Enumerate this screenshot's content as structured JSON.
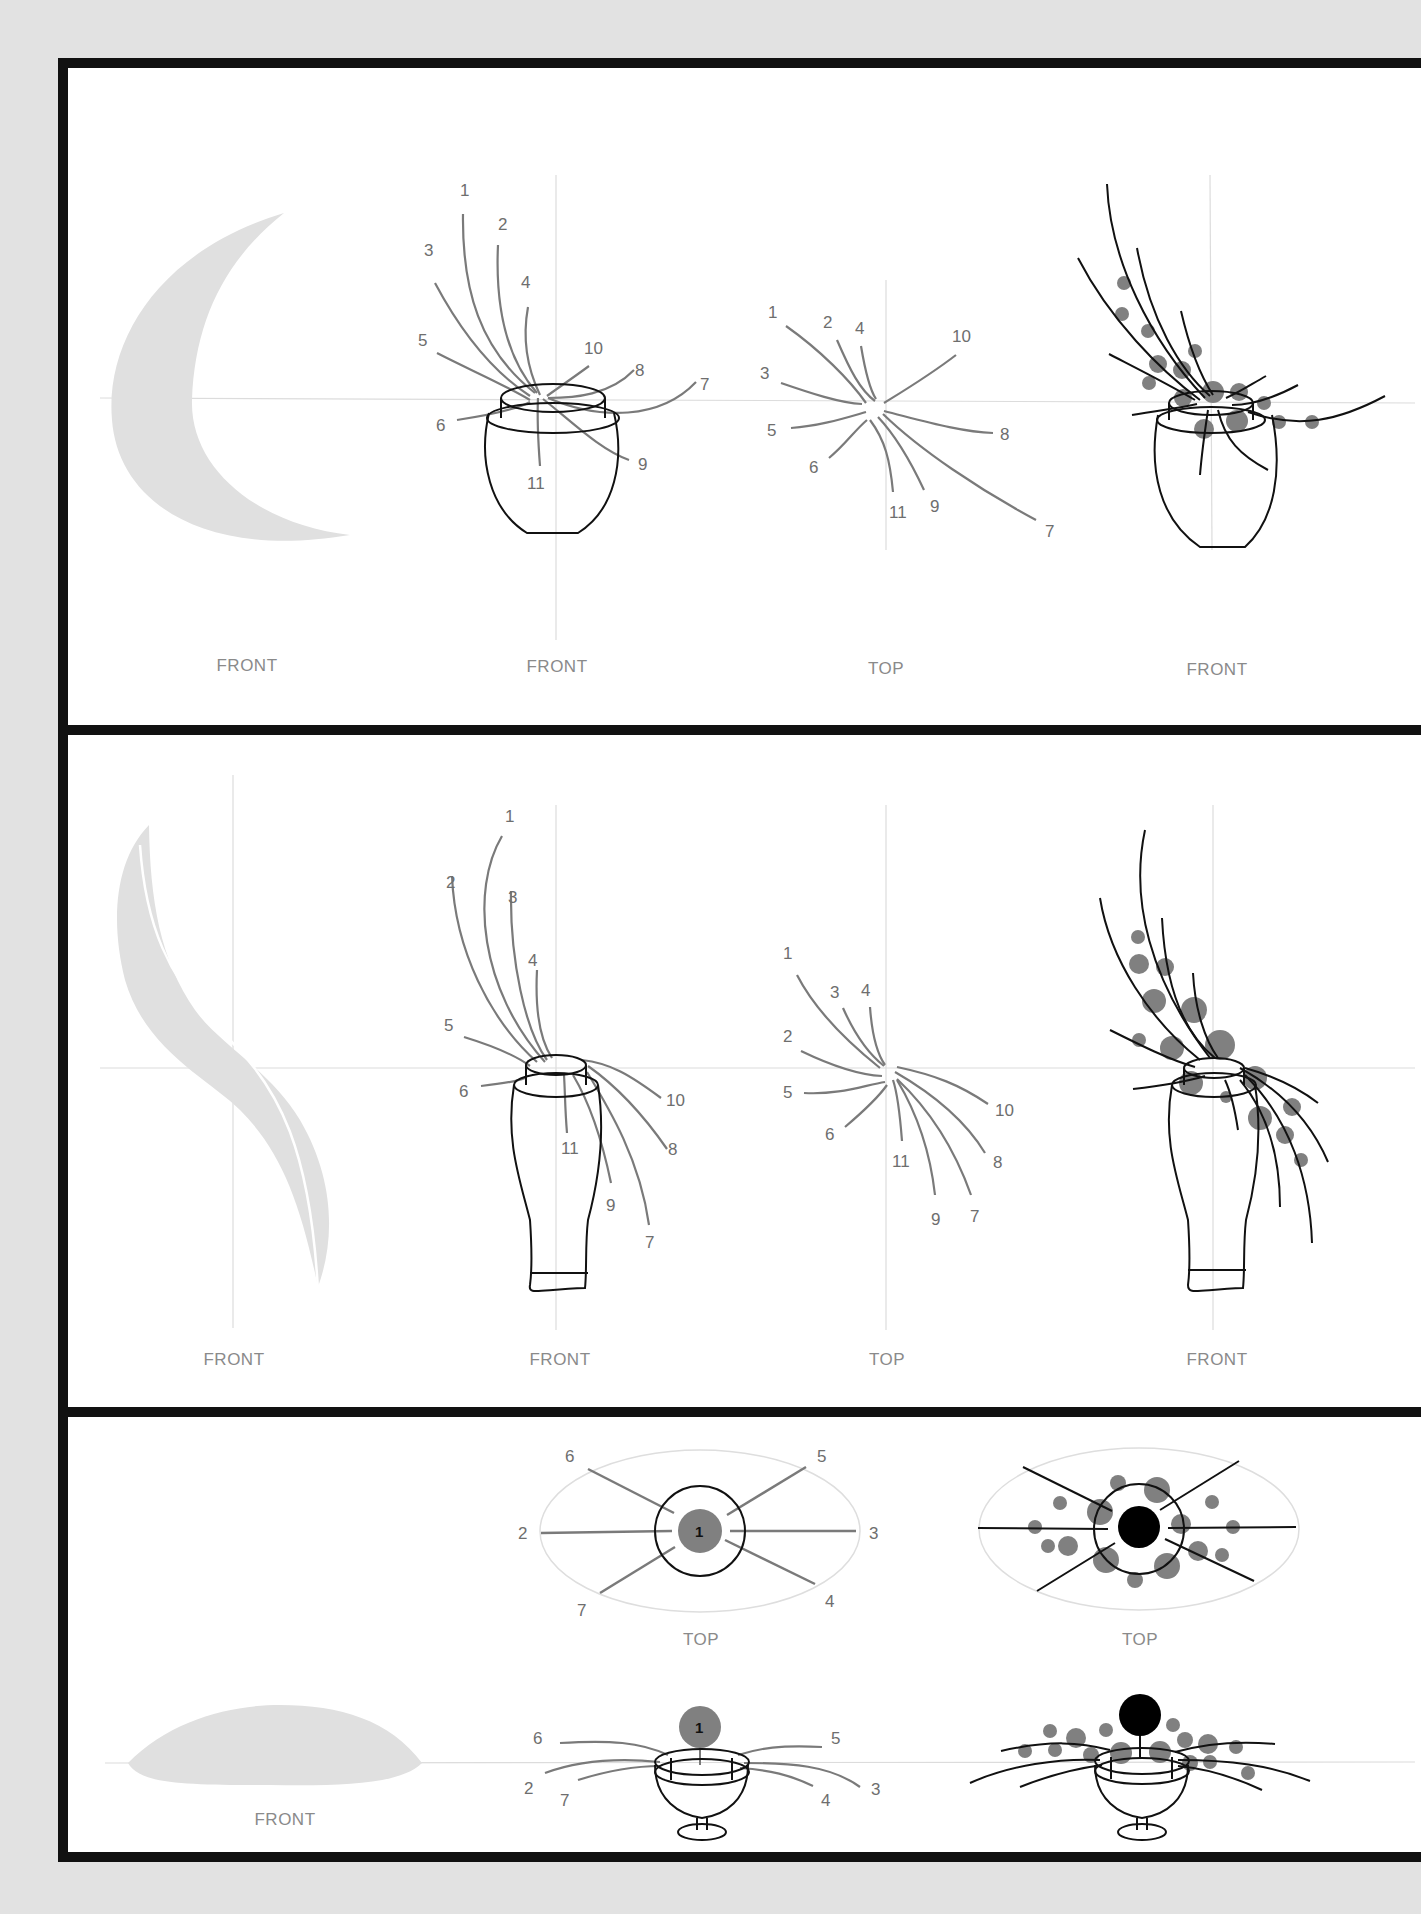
{
  "page": {
    "background_color": "#e2e2e2",
    "frame_color": "#111111",
    "silhouette_color": "#e0e0e0",
    "stem_guide_color": "#7a7a7a",
    "flower_color": "#808080",
    "main_flower_color": "#000000"
  },
  "sections": [
    {
      "id": "crescent",
      "silhouette": "crescent-moon",
      "views": [
        {
          "label": "FRONT",
          "type": "silhouette"
        },
        {
          "label": "FRONT",
          "type": "stem-guide",
          "vessel": "egg-vase",
          "stems": [
            "1",
            "2",
            "3",
            "4",
            "5",
            "6",
            "7",
            "8",
            "9",
            "10",
            "11"
          ]
        },
        {
          "label": "TOP",
          "type": "stem-guide",
          "stems": [
            "1",
            "2",
            "3",
            "4",
            "5",
            "6",
            "7",
            "8",
            "9",
            "10",
            "11"
          ]
        },
        {
          "label": "FRONT",
          "type": "finished-arrangement",
          "vessel": "egg-vase"
        }
      ]
    },
    {
      "id": "s-curve",
      "silhouette": "s-curve-hogarth",
      "views": [
        {
          "label": "FRONT",
          "type": "silhouette"
        },
        {
          "label": "FRONT",
          "type": "stem-guide",
          "vessel": "tall-bottle-vase",
          "stems": [
            "1",
            "2",
            "3",
            "4",
            "5",
            "6",
            "7",
            "8",
            "9",
            "10",
            "11"
          ]
        },
        {
          "label": "TOP",
          "type": "stem-guide",
          "stems": [
            "1",
            "2",
            "3",
            "4",
            "5",
            "6",
            "7",
            "8",
            "9",
            "10",
            "11"
          ]
        },
        {
          "label": "FRONT",
          "type": "finished-arrangement",
          "vessel": "tall-bottle-vase"
        }
      ]
    },
    {
      "id": "low-mound",
      "silhouette": "low-horizontal-mound",
      "views": [
        {
          "label": "TOP",
          "type": "stem-guide",
          "center": "1",
          "stems": [
            "2",
            "3",
            "4",
            "5",
            "6",
            "7"
          ]
        },
        {
          "label": "TOP",
          "type": "finished-arrangement"
        },
        {
          "label": "FRONT",
          "type": "silhouette"
        },
        {
          "label": "",
          "type": "stem-guide",
          "vessel": "footed-bowl",
          "center": "1",
          "stems": [
            "2",
            "3",
            "4",
            "5",
            "6",
            "7"
          ]
        },
        {
          "label": "",
          "type": "finished-arrangement",
          "vessel": "footed-bowl"
        }
      ]
    }
  ]
}
